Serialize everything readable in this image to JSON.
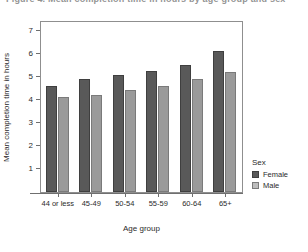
{
  "figure": {
    "title": "Figure 4. Mean completion time in hours by age group and sex",
    "y_axis_title": "Mean completion time in hours",
    "x_axis_title": "Age group"
  },
  "legend": {
    "title": "Sex",
    "entries": [
      {
        "label": "Female",
        "color": "#595959",
        "swatch": "female-swatch"
      },
      {
        "label": "Male",
        "color": "#bdbdbd",
        "swatch": "male-swatch"
      }
    ]
  },
  "chart_data": {
    "type": "bar",
    "title": "Figure 4. Mean completion time in hours by age group and sex",
    "xlabel": "Age group",
    "ylabel": "Mean completion time in hours",
    "categories": [
      "44 or less",
      "45-49",
      "50-54",
      "55-59",
      "60-64",
      "65+"
    ],
    "series": [
      {
        "name": "Female",
        "color": "#595959",
        "values": [
          4.6,
          4.9,
          5.05,
          5.25,
          5.5,
          6.1
        ]
      },
      {
        "name": "Male",
        "color": "#9a9a9a",
        "values": [
          4.1,
          4.2,
          4.4,
          4.6,
          4.9,
          5.2
        ]
      }
    ],
    "yticks": [
      1,
      2,
      3,
      4,
      5,
      6,
      7
    ],
    "ylim": [
      0,
      7.35
    ],
    "grid": false,
    "legend_position": "right"
  }
}
